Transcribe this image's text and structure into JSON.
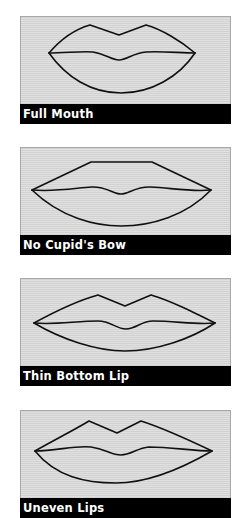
{
  "panels": [
    {
      "label": "Full Mouth"
    },
    {
      "label": "No Cupid's Bow"
    },
    {
      "label": "Thin Bottom Lip"
    },
    {
      "label": "Uneven Lips"
    }
  ],
  "colors": {
    "panel_background": "#d9d9d9",
    "label_background": "#000000",
    "label_text": "#ffffff",
    "outline": "#111111"
  }
}
